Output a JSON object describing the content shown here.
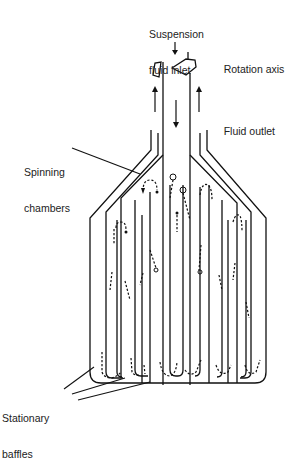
{
  "diagram": {
    "type": "schematic",
    "labels": {
      "inlet_line1": "Suspension",
      "inlet_line2": "fluid inlet",
      "rotation": "Rotation axis",
      "outlet": "Fluid outlet",
      "chambers_line1": "Spinning",
      "chambers_line2": "chambers",
      "baffles_line1": "Stationary",
      "baffles_line2": "baffles"
    },
    "colors": {
      "line": "#111111",
      "text": "#222222",
      "background": "#ffffff"
    },
    "components": [
      {
        "name": "central-inlet-tube",
        "role": "Suspension fluid enters downward"
      },
      {
        "name": "outlet-annulus",
        "role": "Fluid exits upward on both sides"
      },
      {
        "name": "rotation-indicator",
        "role": "Curved arrow showing rotation about vertical axis"
      },
      {
        "name": "spinning-chambers",
        "role": "Nested concentric chambers with dashed particle-flow paths"
      },
      {
        "name": "stationary-baffles",
        "role": "Fixed baffles at the bottom of chambers"
      }
    ]
  }
}
